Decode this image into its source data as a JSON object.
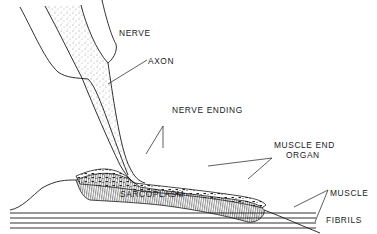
{
  "diagram": {
    "labels": {
      "nerve": "NERVE",
      "axon": "AXON",
      "nerve_ending": "NERVE ENDING",
      "muscle_end_organ_line1": "MUSCLE END",
      "muscle_end_organ_line2": "ORGAN",
      "sarcoplasm": "SARCOPLASM",
      "muscle": "MUSCLE",
      "fibrils": "FIBRILS"
    },
    "colors": {
      "ink": "#1a1a1a",
      "background": "#ffffff"
    }
  }
}
